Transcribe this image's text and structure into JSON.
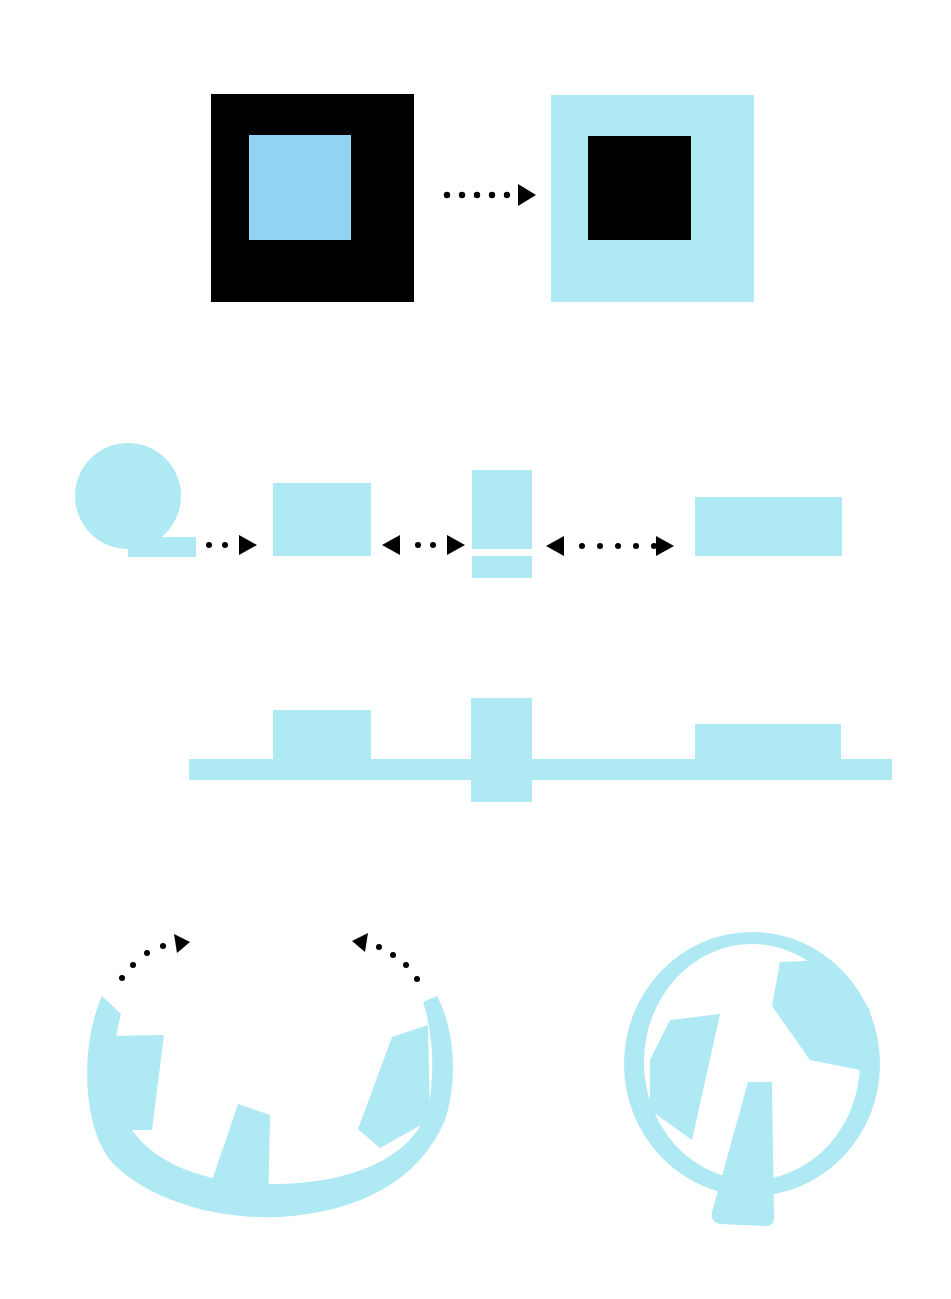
{
  "title": "Shape transformation diagram",
  "colors": {
    "background": "#ffffff",
    "cyan": "#aee9f4",
    "blue": "#92d2f2",
    "black": "#000000",
    "arrow": "#000000"
  },
  "rows": [
    {
      "id": "inversion",
      "description": "Figure-ground inversion: black square with blue inner square becomes cyan square with black inner square",
      "items": [
        {
          "name": "black-square-with-blue-center",
          "outer": "#000000",
          "inner": "#92d2f2"
        },
        {
          "name": "arrow",
          "direction": "right",
          "dots": 5
        },
        {
          "name": "cyan-square-with-black-center",
          "outer": "#aee9f4",
          "inner": "#000000"
        }
      ]
    },
    {
      "id": "decomposition",
      "description": "Circle with tail, arrow to rectangle, bidirectional arrow to split vertical bar, bidirectional arrow to wide rectangle",
      "items": [
        {
          "name": "circle-with-tail"
        },
        {
          "name": "arrow",
          "direction": "right",
          "dots": 2
        },
        {
          "name": "rectangle"
        },
        {
          "name": "arrow",
          "direction": "both",
          "dots": 2
        },
        {
          "name": "split-vertical-bar"
        },
        {
          "name": "arrow",
          "direction": "both",
          "dots": 5
        },
        {
          "name": "wide-rectangle"
        }
      ]
    },
    {
      "id": "alignment",
      "description": "The three shapes aligned on a horizontal bar",
      "items": [
        {
          "name": "horizontal-bar"
        },
        {
          "name": "block-left"
        },
        {
          "name": "block-center-crossing"
        },
        {
          "name": "block-right"
        }
      ]
    },
    {
      "id": "closure",
      "description": "Open arc with notched segments closes into a full circle",
      "items": [
        {
          "name": "open-arc",
          "arrows": [
            "left-arc-arrow-up-right",
            "right-arc-arrow-up-left"
          ]
        },
        {
          "name": "closed-circle"
        }
      ]
    }
  ]
}
